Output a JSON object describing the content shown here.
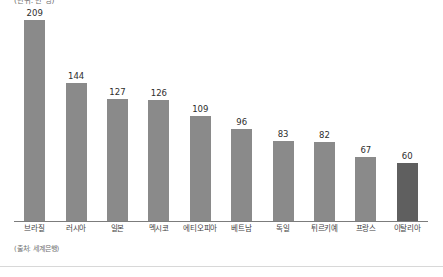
{
  "caption": {
    "unit": "(단위: 만 명)",
    "source": "(출처: 세계은행)"
  },
  "colors": {
    "bar": "#8a8a8a",
    "bar_highlight": "#5f5f5f",
    "axis": "#7c7c7c",
    "rule": "#d8d8d8",
    "value_text": "#2e2e2e",
    "label_text": "#3f3f3f",
    "caption_text": "#6f6f6f"
  },
  "chart_data": {
    "type": "bar",
    "title": "(단위: 만 명)",
    "xlabel": "",
    "ylabel": "",
    "ylim": [
      0,
      209
    ],
    "grid": false,
    "legend": false,
    "categories": [
      "브라질",
      "러시아",
      "일본",
      "멕시코",
      "에티오피아",
      "베트남",
      "독일",
      "튀르키예",
      "프랑스",
      "이탈리아"
    ],
    "values": [
      209,
      144,
      127,
      126,
      109,
      96,
      83,
      82,
      67,
      60
    ],
    "value_labels": [
      "209",
      "144",
      "127",
      "126",
      "109",
      "96",
      "83",
      "82",
      "67",
      "60"
    ],
    "highlight_index": 9,
    "annotations": [
      "(출처: 세계은행)"
    ]
  }
}
